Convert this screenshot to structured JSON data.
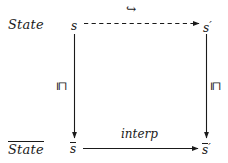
{
  "diagram": {
    "type": "commutative-square",
    "background_color": "#ffffff",
    "stroke_color": "#1a1a1a",
    "row_labels": {
      "top": "State",
      "bottom": "State",
      "bottom_has_overline": true
    },
    "nodes": {
      "top_left": {
        "base": "s",
        "prime": "",
        "overline": false
      },
      "top_right": {
        "base": "s",
        "prime": "′",
        "overline": false
      },
      "bottom_left": {
        "base": "s",
        "prime": "",
        "overline": true
      },
      "bottom_right": {
        "base": "s",
        "prime": "′",
        "overline": true
      }
    },
    "edges": [
      {
        "name": "top-edge",
        "from": "s",
        "to": "s′",
        "label": "↪",
        "label_name": "hook-right-arrow-icon",
        "style": "dashed",
        "direction": "right"
      },
      {
        "name": "left-edge",
        "from": "s",
        "to": "s̅",
        "label": "⊑",
        "label_name": "square-image-of-or-equal-icon",
        "style": "solid",
        "direction": "down"
      },
      {
        "name": "right-edge",
        "from": "s′",
        "to": "s̅′",
        "label": "⊑",
        "label_name": "square-image-of-or-equal-icon",
        "style": "solid",
        "direction": "down"
      },
      {
        "name": "bottom-edge",
        "from": "s̅",
        "to": "s̅′",
        "label": "interp",
        "label_name": "interp-label",
        "style": "solid",
        "direction": "right"
      }
    ]
  }
}
